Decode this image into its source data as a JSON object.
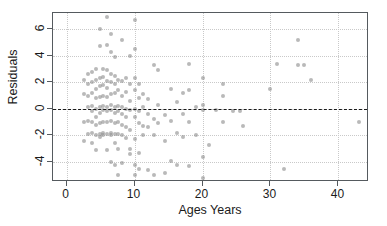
{
  "chart_data": {
    "type": "scatter",
    "title": "",
    "xlabel": "Ages Years",
    "ylabel": "Residuals",
    "xlim": [
      -2,
      44.5
    ],
    "ylim": [
      -5.5,
      7.2
    ],
    "xticks": [
      0,
      10,
      20,
      30,
      40
    ],
    "xticklabels": [
      "0",
      "10",
      "20",
      "30",
      "40"
    ],
    "yticks": [
      6,
      4,
      2,
      0,
      -2,
      -4
    ],
    "yticklabels": [
      "6",
      "4",
      "2",
      "0",
      "-2",
      "-4"
    ],
    "grid": true,
    "grid_style": "dotted",
    "grid_color": "#c9c9c9",
    "legend": null,
    "marker_color": "#8e8e8e",
    "marker_opacity": 0.62,
    "reference_lines": [
      {
        "name": "zero-residual-line",
        "orientation": "horizontal",
        "y": 0,
        "style": "dashed",
        "color": "#1a1a1a"
      }
    ],
    "points": [
      [
        2.6,
        2.2
      ],
      [
        2.6,
        1.1
      ],
      [
        2.6,
        -1.0
      ],
      [
        2.6,
        -2.4
      ],
      [
        3.2,
        2.6
      ],
      [
        3.2,
        1.9
      ],
      [
        3.2,
        1.0
      ],
      [
        3.2,
        0.1
      ],
      [
        3.2,
        -0.9
      ],
      [
        3.2,
        -1.9
      ],
      [
        3.8,
        2.8
      ],
      [
        3.8,
        2.0
      ],
      [
        3.8,
        1.2
      ],
      [
        3.8,
        0.2
      ],
      [
        3.8,
        -0.2
      ],
      [
        3.8,
        -1.0
      ],
      [
        3.8,
        -1.8
      ],
      [
        3.8,
        -2.6
      ],
      [
        4.3,
        3.0
      ],
      [
        4.3,
        2.2
      ],
      [
        4.3,
        1.5
      ],
      [
        4.3,
        0.8
      ],
      [
        4.3,
        0.0
      ],
      [
        4.3,
        -0.6
      ],
      [
        4.3,
        -1.2
      ],
      [
        4.3,
        -2.0
      ],
      [
        4.3,
        -3.1
      ],
      [
        4.9,
        6.0
      ],
      [
        4.9,
        4.7
      ],
      [
        4.9,
        2.3
      ],
      [
        4.9,
        1.7
      ],
      [
        4.9,
        0.9
      ],
      [
        4.9,
        0.1
      ],
      [
        4.9,
        -0.3
      ],
      [
        4.9,
        -1.1
      ],
      [
        4.9,
        -1.9
      ],
      [
        4.9,
        -2.1
      ],
      [
        5.4,
        3.0
      ],
      [
        5.4,
        2.4
      ],
      [
        5.4,
        1.8
      ],
      [
        5.4,
        1.0
      ],
      [
        5.4,
        0.2
      ],
      [
        5.4,
        -0.1
      ],
      [
        5.4,
        -1.0
      ],
      [
        5.4,
        -1.8
      ],
      [
        5.4,
        -2.0
      ],
      [
        6.0,
        6.9
      ],
      [
        6.0,
        4.8
      ],
      [
        6.0,
        2.9
      ],
      [
        6.0,
        2.1
      ],
      [
        6.0,
        1.6
      ],
      [
        6.0,
        0.9
      ],
      [
        6.0,
        0.1
      ],
      [
        6.0,
        -0.2
      ],
      [
        6.0,
        -1.0
      ],
      [
        6.0,
        -1.9
      ],
      [
        6.0,
        -3.1
      ],
      [
        6.5,
        5.6
      ],
      [
        6.5,
        4.3
      ],
      [
        6.5,
        2.6
      ],
      [
        6.5,
        2.0
      ],
      [
        6.5,
        1.1
      ],
      [
        6.5,
        0.3
      ],
      [
        6.5,
        -0.1
      ],
      [
        6.5,
        -0.9
      ],
      [
        6.5,
        -1.8
      ],
      [
        6.5,
        -2.0
      ],
      [
        6.5,
        -4.0
      ],
      [
        7.1,
        3.9
      ],
      [
        7.1,
        2.5
      ],
      [
        7.1,
        1.9
      ],
      [
        7.1,
        1.2
      ],
      [
        7.1,
        0.1
      ],
      [
        7.1,
        -0.3
      ],
      [
        7.1,
        -1.1
      ],
      [
        7.1,
        -1.9
      ],
      [
        7.1,
        -2.6
      ],
      [
        7.1,
        -4.2
      ],
      [
        7.6,
        2.2
      ],
      [
        7.6,
        1.4
      ],
      [
        7.6,
        0.2
      ],
      [
        7.6,
        -0.2
      ],
      [
        7.6,
        -1.0
      ],
      [
        7.6,
        -1.9
      ],
      [
        7.6,
        -3.0
      ],
      [
        7.6,
        -5.0
      ],
      [
        8.2,
        5.2
      ],
      [
        8.2,
        2.1
      ],
      [
        8.2,
        1.0
      ],
      [
        8.2,
        0.1
      ],
      [
        8.2,
        -0.4
      ],
      [
        8.2,
        -1.2
      ],
      [
        8.2,
        -2.0
      ],
      [
        8.2,
        -4.1
      ],
      [
        8.8,
        2.3
      ],
      [
        8.8,
        1.3
      ],
      [
        8.8,
        0.0
      ],
      [
        8.8,
        -0.6
      ],
      [
        8.8,
        -1.4
      ],
      [
        8.8,
        -2.2
      ],
      [
        9.4,
        4.0
      ],
      [
        9.4,
        1.9
      ],
      [
        9.4,
        0.6
      ],
      [
        9.4,
        -0.1
      ],
      [
        9.4,
        -1.6
      ],
      [
        9.4,
        -3.0
      ],
      [
        9.4,
        -3.4
      ],
      [
        10.0,
        6.7
      ],
      [
        10.0,
        4.5
      ],
      [
        10.0,
        2.3
      ],
      [
        10.0,
        1.4
      ],
      [
        10.0,
        0.0
      ],
      [
        10.0,
        -0.6
      ],
      [
        10.0,
        -2.3
      ],
      [
        10.0,
        -4.2
      ],
      [
        10.0,
        -5.0
      ],
      [
        10.6,
        1.9
      ],
      [
        10.6,
        0.8
      ],
      [
        10.6,
        -0.2
      ],
      [
        10.6,
        -1.1
      ],
      [
        10.6,
        -3.3
      ],
      [
        10.6,
        -4.5
      ],
      [
        11.3,
        1.1
      ],
      [
        11.3,
        0.1
      ],
      [
        11.3,
        -1.3
      ],
      [
        11.3,
        -2.0
      ],
      [
        12.0,
        0.7
      ],
      [
        12.0,
        -0.4
      ],
      [
        12.0,
        -1.4
      ],
      [
        12.0,
        -4.6
      ],
      [
        12.8,
        3.3
      ],
      [
        12.8,
        -0.8
      ],
      [
        12.8,
        -2.0
      ],
      [
        12.8,
        -5.0
      ],
      [
        13.5,
        2.9
      ],
      [
        13.5,
        0.3
      ],
      [
        13.5,
        -1.1
      ],
      [
        14.5,
        -0.5
      ],
      [
        14.5,
        -2.4
      ],
      [
        14.5,
        -4.8
      ],
      [
        15.4,
        1.5
      ],
      [
        15.4,
        -0.9
      ],
      [
        15.4,
        -3.9
      ],
      [
        16.3,
        0.5
      ],
      [
        16.3,
        -1.8
      ],
      [
        16.3,
        -4.2
      ],
      [
        17.2,
        1.2
      ],
      [
        17.2,
        -0.4
      ],
      [
        17.2,
        -2.1
      ],
      [
        18.0,
        3.4
      ],
      [
        18.0,
        1.4
      ],
      [
        18.0,
        -1.0
      ],
      [
        18.0,
        -4.3
      ],
      [
        19.0,
        0.1
      ],
      [
        19.0,
        -2.0
      ],
      [
        20.0,
        2.3
      ],
      [
        20.0,
        0.3
      ],
      [
        20.0,
        -0.1
      ],
      [
        20.0,
        -3.6
      ],
      [
        20.0,
        -5.2
      ],
      [
        21.0,
        -2.7
      ],
      [
        22.0,
        -0.1
      ],
      [
        23.0,
        1.9
      ],
      [
        23.0,
        1.0
      ],
      [
        23.0,
        -1.0
      ],
      [
        24.5,
        -0.2
      ],
      [
        25.5,
        -0.2
      ],
      [
        26.0,
        -1.3
      ],
      [
        30.0,
        1.5
      ],
      [
        31.0,
        3.4
      ],
      [
        32.0,
        -4.5
      ],
      [
        34.0,
        5.2
      ],
      [
        34.0,
        3.3
      ],
      [
        35.0,
        3.3
      ],
      [
        36.0,
        2.2
      ],
      [
        43.0,
        -1.0
      ]
    ]
  }
}
